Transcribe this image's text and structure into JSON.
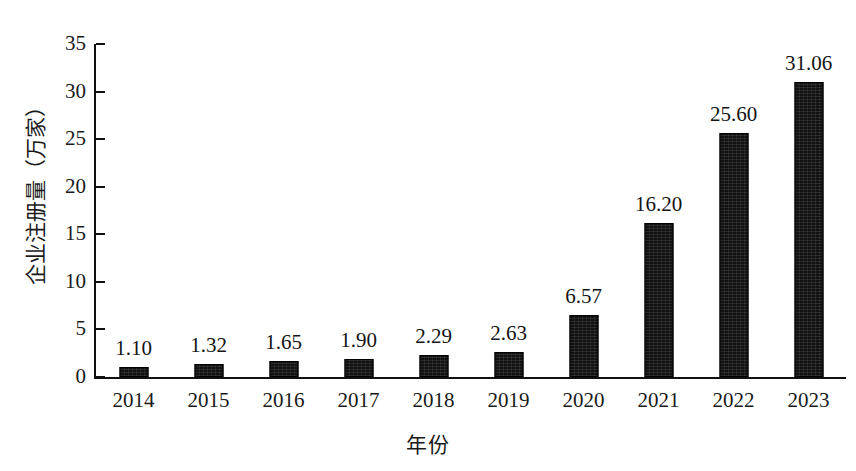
{
  "chart_data": {
    "type": "bar",
    "title": "",
    "subtitle": "",
    "xlabel": "年份",
    "ylabel": "企业注册量（万家）",
    "categories": [
      "2014",
      "2015",
      "2016",
      "2017",
      "2018",
      "2019",
      "2020",
      "2021",
      "2022",
      "2023"
    ],
    "values": [
      1.1,
      1.32,
      1.65,
      1.9,
      2.29,
      2.63,
      6.57,
      16.2,
      25.6,
      31.06
    ],
    "value_labels": [
      "1.10",
      "1.32",
      "1.65",
      "1.90",
      "2.29",
      "2.63",
      "6.57",
      "16.20",
      "25.60",
      "31.06"
    ],
    "ylim": [
      0,
      35
    ],
    "y_ticks": [
      0,
      5,
      10,
      15,
      20,
      25,
      30,
      35
    ],
    "y_tick_labels": [
      "0",
      "5",
      "10",
      "15",
      "20",
      "25",
      "30",
      "35"
    ],
    "grid": false,
    "legend": false,
    "legend_position": "none",
    "bar_color": "#111111",
    "axis_color": "#111111",
    "background_color": "#ffffff"
  },
  "figure": {
    "caption": ""
  }
}
